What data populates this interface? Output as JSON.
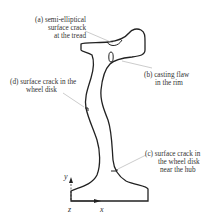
{
  "figure": {
    "labels": {
      "a": {
        "lines": [
          "(a) semi-elliptical",
          "surface crack",
          "at the tread"
        ]
      },
      "b": {
        "lines": [
          "(b) casting flaw",
          "in the rim"
        ]
      },
      "c": {
        "lines": [
          "(c) surface crack in",
          "the wheel disk",
          "near the hub"
        ]
      },
      "d": {
        "lines": [
          "(d) surface crack in the",
          "wheel disk"
        ]
      }
    },
    "axes": {
      "y": "y",
      "x": "x",
      "z": "z"
    },
    "colors": {
      "outline": "#222222",
      "leader": "#aaaaaa",
      "text": "#333333"
    }
  }
}
